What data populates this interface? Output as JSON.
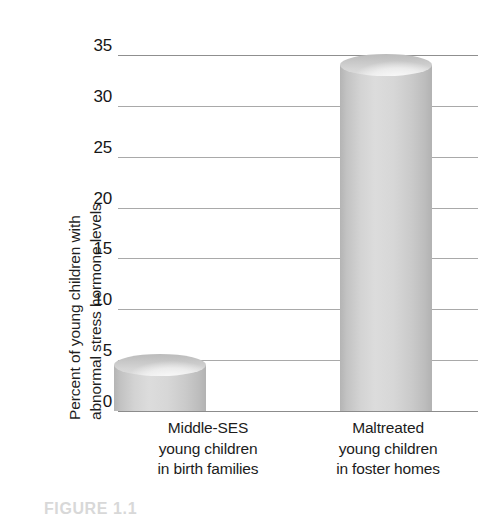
{
  "chart_data": {
    "type": "bar",
    "title": "",
    "subtitle": "",
    "xlabel": "",
    "ylabel_line1": "Percent of young children with",
    "ylabel_line2": "abnormal stress hormone levels",
    "categories": [
      "Middle-SES young children in birth families",
      "Maltreated young children in foster homes"
    ],
    "category_lines": [
      [
        "Middle-SES",
        "young children",
        "in birth families"
      ],
      [
        "Maltreated",
        "young children",
        "in foster homes"
      ]
    ],
    "values": [
      4.5,
      34
    ],
    "ylim": [
      0,
      35
    ],
    "yticks": [
      0,
      5,
      10,
      15,
      20,
      25,
      30,
      35
    ],
    "ytick_labels": [
      "0",
      "5",
      "10",
      "15",
      "20",
      "25",
      "30",
      "35"
    ],
    "grid": true,
    "legend": "none",
    "bar_style": "cylinder",
    "bar_color": "#d4d4d4",
    "gridline_color": "#a9a9a9",
    "axis_color": "#8c8c8c",
    "text_color": "#1a1a1a"
  },
  "caption": {
    "text": "FIGURE 1.1"
  }
}
